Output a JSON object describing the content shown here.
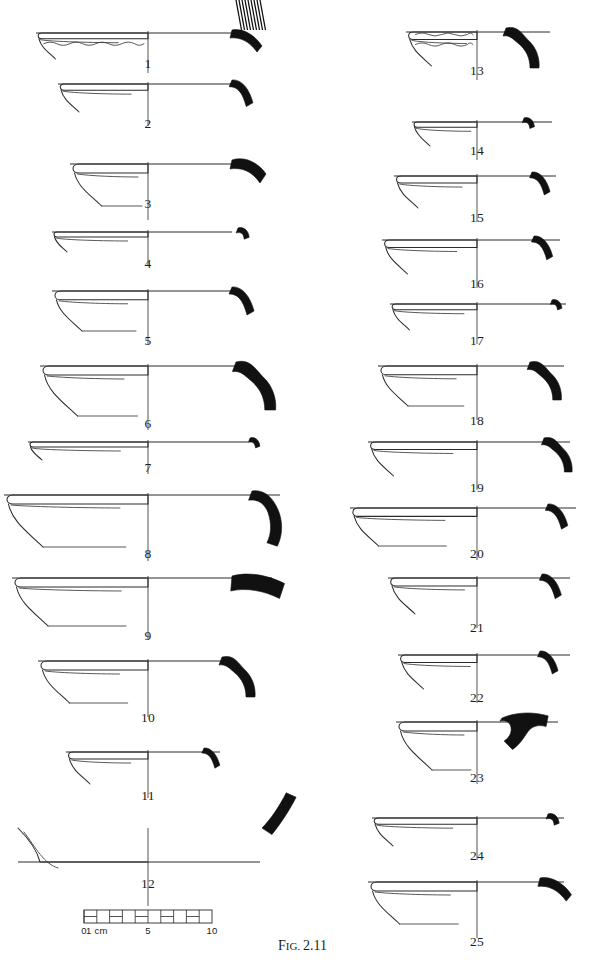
{
  "figure": {
    "caption_prefix": "Fig.",
    "caption_number": "2.11",
    "caption_full": "Fig. 2.11",
    "plate_type": "archaeological pottery rim profile typology plate",
    "total_items": 25,
    "ink_color": "#111111",
    "line_color": "#2b2b2b",
    "background_color": "#ffffff"
  },
  "scale_bar": {
    "name": "scale-bar",
    "units": "cm",
    "total_length_cm": 10,
    "segment_cm": 1,
    "labels": [
      {
        "text": "0",
        "cm": 0
      },
      {
        "text": "1 cm",
        "cm": 1
      },
      {
        "text": "5",
        "cm": 5
      },
      {
        "text": "10",
        "cm": 10
      }
    ]
  },
  "columns": {
    "left": {
      "name": "left-column",
      "centerline_x": 148,
      "item_numbers": [
        1,
        2,
        3,
        4,
        5,
        6,
        7,
        8,
        9,
        10,
        11,
        12
      ]
    },
    "right": {
      "name": "right-column",
      "centerline_x": 477,
      "item_numbers": [
        13,
        14,
        15,
        16,
        17,
        18,
        19,
        20,
        21,
        22,
        23,
        24,
        25
      ]
    }
  },
  "vessels": [
    {
      "num": "1",
      "label": "1",
      "col": "left",
      "label_x": 148,
      "label_y": 68,
      "rim_y": 33,
      "cx": 148,
      "rim_left": 36,
      "rim_right": 232,
      "depth": 26,
      "form": "large platter with wavy combed interior band",
      "decoration": "wavy-line",
      "hatching": true,
      "profile_x": 232,
      "profile_y": 30,
      "profile_scale": 1.0,
      "profile_shape": "hooked-everted"
    },
    {
      "num": "2",
      "label": "2",
      "col": "left",
      "label_x": 148,
      "label_y": 128,
      "rim_y": 84,
      "cx": 148,
      "rim_left": 58,
      "rim_right": 232,
      "depth": 28,
      "form": "carinated bowl, flaring wall",
      "decoration": "none",
      "hatching": false,
      "profile_x": 232,
      "profile_y": 80,
      "profile_scale": 0.95,
      "profile_shape": "curved-everted"
    },
    {
      "num": "3",
      "label": "3",
      "col": "left",
      "label_x": 148,
      "label_y": 208,
      "rim_y": 164,
      "cx": 148,
      "rim_left": 70,
      "rim_right": 232,
      "depth": 42,
      "form": "deep bowl with flattened rim and ledge",
      "decoration": "none",
      "hatching": false,
      "profile_x": 232,
      "profile_y": 160,
      "profile_scale": 1.0,
      "profile_shape": "thick-everted"
    },
    {
      "num": "4",
      "label": "4",
      "col": "left",
      "label_x": 148,
      "label_y": 268,
      "rim_y": 232,
      "cx": 148,
      "rim_left": 52,
      "rim_right": 232,
      "depth": 20,
      "form": "shallow open bowl",
      "decoration": "none",
      "hatching": false,
      "profile_x": 238,
      "profile_y": 228,
      "profile_scale": 0.62,
      "profile_shape": "short-hook"
    },
    {
      "num": "5",
      "label": "5",
      "col": "left",
      "label_x": 148,
      "label_y": 345,
      "rim_y": 291,
      "cx": 148,
      "rim_left": 52,
      "rim_right": 232,
      "depth": 40,
      "form": "open bowl, splayed wall",
      "decoration": "none",
      "hatching": false,
      "profile_x": 232,
      "profile_y": 287,
      "profile_scale": 1.0,
      "profile_shape": "curved-everted"
    },
    {
      "num": "6",
      "label": "6",
      "col": "left",
      "label_x": 148,
      "label_y": 428,
      "rim_y": 366,
      "cx": 148,
      "rim_left": 40,
      "rim_right": 240,
      "depth": 50,
      "form": "large open bowl with pronounced flare",
      "decoration": "none",
      "hatching": false,
      "profile_x": 236,
      "profile_y": 362,
      "profile_scale": 1.2,
      "profile_shape": "s-curve"
    },
    {
      "num": "7",
      "label": "7",
      "col": "left",
      "label_x": 148,
      "label_y": 472,
      "rim_y": 442,
      "cx": 148,
      "rim_left": 28,
      "rim_right": 248,
      "depth": 18,
      "form": "very shallow plate",
      "decoration": "none",
      "hatching": false,
      "profile_x": 250,
      "profile_y": 438,
      "profile_scale": 0.55,
      "profile_shape": "short-hook"
    },
    {
      "num": "8",
      "label": "8",
      "col": "left",
      "label_x": 148,
      "label_y": 558,
      "rim_y": 495,
      "cx": 148,
      "rim_left": 4,
      "rim_right": 280,
      "depth": 52,
      "form": "very large deep basin with interior ledge",
      "decoration": "none",
      "hatching": false,
      "profile_x": 252,
      "profile_y": 491,
      "profile_scale": 1.15,
      "profile_shape": "long-curved"
    },
    {
      "num": "9",
      "label": "9",
      "col": "left",
      "label_x": 148,
      "label_y": 640,
      "rim_y": 578,
      "cx": 148,
      "rim_left": 12,
      "rim_right": 272,
      "depth": 48,
      "form": "wide shallow platter, thin wall",
      "decoration": "none",
      "hatching": false,
      "profile_x": 232,
      "profile_y": 576,
      "profile_scale": 1.25,
      "profile_shape": "thick-bar"
    },
    {
      "num": "10",
      "label": "10",
      "col": "left",
      "label_x": 148,
      "label_y": 722,
      "rim_y": 661,
      "cx": 148,
      "rim_left": 38,
      "rim_right": 232,
      "depth": 42,
      "form": "bowl with thickened rim",
      "decoration": "none",
      "hatching": false,
      "profile_x": 222,
      "profile_y": 657,
      "profile_scale": 1.0,
      "profile_shape": "s-curve"
    },
    {
      "num": "11",
      "label": "11",
      "col": "left",
      "label_x": 148,
      "label_y": 800,
      "rim_y": 752,
      "cx": 148,
      "rim_left": 66,
      "rim_right": 220,
      "depth": 32,
      "form": "small bowl, rounded rim",
      "decoration": "none",
      "hatching": false,
      "profile_x": 204,
      "profile_y": 748,
      "profile_scale": 0.72,
      "profile_shape": "curved-everted"
    },
    {
      "num": "12",
      "label": "12",
      "col": "left",
      "label_x": 148,
      "label_y": 888,
      "rim_y": 862,
      "cx": 148,
      "rim_left": 18,
      "rim_right": 260,
      "depth": 30,
      "form": "flat platter with sharply everted rim",
      "decoration": "none",
      "hatching": false,
      "profile_x": 262,
      "profile_y": 828,
      "profile_scale": 1.1,
      "profile_shape": "angled-up"
    },
    {
      "num": "13",
      "label": "13",
      "col": "right",
      "label_x": 477,
      "label_y": 75,
      "rim_y": 32,
      "cx": 477,
      "rim_left": 406,
      "rim_right": 550,
      "depth": 34,
      "form": "bowl with wavy (combed) rim band",
      "decoration": "wavy-line",
      "hatching": false,
      "profile_x": 506,
      "profile_y": 28,
      "profile_scale": 1.0,
      "profile_shape": "s-curve"
    },
    {
      "num": "14",
      "label": "14",
      "col": "right",
      "label_x": 477,
      "label_y": 155,
      "rim_y": 122,
      "cx": 477,
      "rim_left": 412,
      "rim_right": 552,
      "depth": 24,
      "form": "small shallow bowl",
      "decoration": "none",
      "hatching": false,
      "profile_x": 524,
      "profile_y": 118,
      "profile_scale": 0.58,
      "profile_shape": "short-hook"
    },
    {
      "num": "15",
      "label": "15",
      "col": "right",
      "label_x": 477,
      "label_y": 222,
      "rim_y": 176,
      "cx": 477,
      "rim_left": 394,
      "rim_right": 556,
      "depth": 32,
      "form": "open bowl, flaring wall",
      "decoration": "none",
      "hatching": false,
      "profile_x": 532,
      "profile_y": 172,
      "profile_scale": 0.82,
      "profile_shape": "curved-everted"
    },
    {
      "num": "16",
      "label": "16",
      "col": "right",
      "label_x": 477,
      "label_y": 288,
      "rim_y": 240,
      "cx": 477,
      "rim_left": 382,
      "rim_right": 560,
      "depth": 34,
      "form": "open bowl with long splayed wall",
      "decoration": "none",
      "hatching": false,
      "profile_x": 534,
      "profile_y": 236,
      "profile_scale": 0.85,
      "profile_shape": "curved-everted"
    },
    {
      "num": "17",
      "label": "17",
      "col": "right",
      "label_x": 477,
      "label_y": 345,
      "rim_y": 304,
      "cx": 477,
      "rim_left": 390,
      "rim_right": 566,
      "depth": 26,
      "form": "shallow bowl",
      "decoration": "none",
      "hatching": false,
      "profile_x": 552,
      "profile_y": 300,
      "profile_scale": 0.55,
      "profile_shape": "short-hook"
    },
    {
      "num": "18",
      "label": "18",
      "col": "right",
      "label_x": 477,
      "label_y": 425,
      "rim_y": 366,
      "cx": 477,
      "rim_left": 378,
      "rim_right": 564,
      "depth": 40,
      "form": "bowl with everted lip and carination",
      "decoration": "none",
      "hatching": false,
      "profile_x": 530,
      "profile_y": 362,
      "profile_scale": 0.95,
      "profile_shape": "s-curve"
    },
    {
      "num": "19",
      "label": "19",
      "col": "right",
      "label_x": 477,
      "label_y": 492,
      "rim_y": 442,
      "cx": 477,
      "rim_left": 368,
      "rim_right": 570,
      "depth": 34,
      "form": "open bowl, thin wall",
      "decoration": "none",
      "hatching": false,
      "profile_x": 544,
      "profile_y": 438,
      "profile_scale": 0.85,
      "profile_shape": "s-curve"
    },
    {
      "num": "20",
      "label": "20",
      "col": "right",
      "label_x": 477,
      "label_y": 558,
      "rim_y": 508,
      "cx": 477,
      "rim_left": 350,
      "rim_right": 576,
      "depth": 38,
      "form": "wide open bowl",
      "decoration": "none",
      "hatching": false,
      "profile_x": 548,
      "profile_y": 504,
      "profile_scale": 0.9,
      "profile_shape": "curved-everted"
    },
    {
      "num": "21",
      "label": "21",
      "col": "right",
      "label_x": 477,
      "label_y": 632,
      "rim_y": 578,
      "cx": 477,
      "rim_left": 388,
      "rim_right": 570,
      "depth": 36,
      "form": "bowl with flattened rim",
      "decoration": "none",
      "hatching": false,
      "profile_x": 542,
      "profile_y": 574,
      "profile_scale": 0.88,
      "profile_shape": "curved-everted"
    },
    {
      "num": "22",
      "label": "22",
      "col": "right",
      "label_x": 477,
      "label_y": 702,
      "rim_y": 655,
      "cx": 477,
      "rim_left": 398,
      "rim_right": 570,
      "depth": 34,
      "form": "bowl with rounded rim and lower ledge",
      "decoration": "none",
      "hatching": false,
      "profile_x": 540,
      "profile_y": 651,
      "profile_scale": 0.82,
      "profile_shape": "curved-everted"
    },
    {
      "num": "23",
      "label": "23",
      "col": "right",
      "label_x": 477,
      "label_y": 782,
      "rim_y": 722,
      "cx": 477,
      "rim_left": 396,
      "rim_right": 558,
      "depth": 48,
      "form": "bowl with stepped/ledged interior and everted rim",
      "decoration": "none",
      "hatching": false,
      "profile_x": 502,
      "profile_y": 718,
      "profile_scale": 1.05,
      "profile_shape": "stepped-everted"
    },
    {
      "num": "24",
      "label": "24",
      "col": "right",
      "label_x": 477,
      "label_y": 860,
      "rim_y": 818,
      "cx": 477,
      "rim_left": 372,
      "rim_right": 564,
      "depth": 28,
      "form": "shallow open bowl",
      "decoration": "none",
      "hatching": false,
      "profile_x": 548,
      "profile_y": 814,
      "profile_scale": 0.62,
      "profile_shape": "short-hook"
    },
    {
      "num": "25",
      "label": "25",
      "col": "right",
      "label_x": 477,
      "label_y": 946,
      "rim_y": 882,
      "cx": 477,
      "rim_left": 368,
      "rim_right": 564,
      "depth": 42,
      "form": "bowl with thick rounded rim and ledge",
      "decoration": "none",
      "hatching": false,
      "profile_x": 540,
      "profile_y": 878,
      "profile_scale": 1.05,
      "profile_shape": "hooked-everted"
    }
  ]
}
